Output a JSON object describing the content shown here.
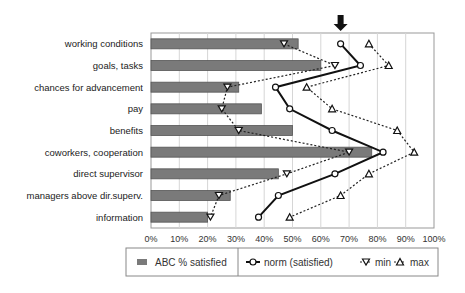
{
  "chart_data": {
    "type": "bar",
    "orientation": "horizontal",
    "title": "",
    "xlabel": "",
    "ylabel": "",
    "xlim": [
      0,
      100
    ],
    "x_tick_labels": [
      "0%",
      "10%",
      "20%",
      "30%",
      "40%",
      "50%",
      "60%",
      "70%",
      "80%",
      "90%",
      "100%"
    ],
    "grid": "vertical",
    "legend_position": "bottom",
    "categories": [
      "working conditions",
      "goals, tasks",
      "chances for advancement",
      "pay",
      "benefits",
      "coworkers, cooperation",
      "direct supervisor",
      "managers above dir.superv.",
      "information"
    ],
    "series": [
      {
        "name": "ABC % satisfied",
        "type": "bar",
        "color": "#7a7a7a",
        "values": [
          52,
          60,
          31,
          39,
          50,
          78,
          45,
          28,
          20
        ]
      },
      {
        "name": "norm (satisfied)",
        "type": "line",
        "style": "solid",
        "marker": "circle",
        "color": "#111111",
        "values": [
          67,
          74,
          44,
          49,
          64,
          82,
          65,
          45,
          38
        ]
      },
      {
        "name": "min",
        "type": "line",
        "style": "dotted",
        "marker": "triangle-down",
        "color": "#222222",
        "values": [
          47,
          65,
          27,
          25,
          31,
          70,
          48,
          24,
          21
        ]
      },
      {
        "name": "max",
        "type": "line",
        "style": "dotted",
        "marker": "triangle-up",
        "color": "#222222",
        "values": [
          77,
          84,
          55,
          64,
          87,
          93,
          77,
          67,
          49
        ]
      }
    ],
    "annotations": [
      {
        "type": "arrow-down",
        "x": 67,
        "position": "above working conditions norm"
      }
    ]
  }
}
